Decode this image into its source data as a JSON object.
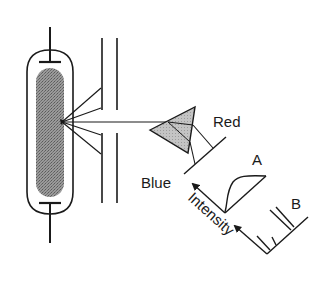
{
  "diagram": {
    "type": "spectroscope-schematic",
    "components": {
      "discharge_tube": {
        "fill_color": "#8a8a8a"
      },
      "slit": {},
      "prism": {
        "fill_color": "#bdbdbd"
      },
      "screen": {}
    },
    "labels": {
      "red": "Red",
      "blue": "Blue",
      "spectrum_a": "A",
      "spectrum_b": "B",
      "intensity": "Intensity"
    },
    "colors": {
      "ink": "#1a1a1a",
      "background": "#ffffff"
    }
  }
}
